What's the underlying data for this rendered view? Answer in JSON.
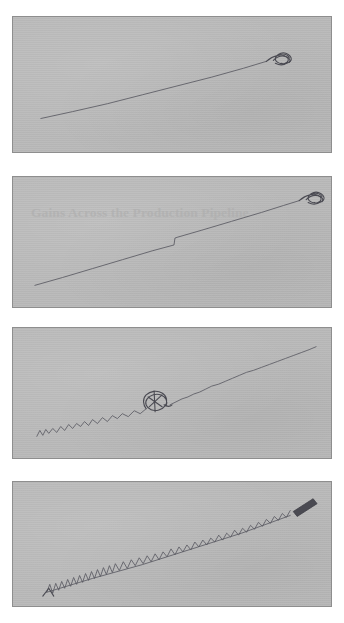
{
  "page": {
    "background_color": "#ffffff",
    "panel_fill_color": "#b9b9b9",
    "panel_border_color": "#8e8e8e",
    "ink_color": "#5e5e66"
  },
  "watermark": {
    "text": "Gains Across the Production Pipeline"
  },
  "panels": [
    {
      "id": "panel-1",
      "name": "sketch-panel-1",
      "description": "clean ascending straight line with small scribble blob at upper right end",
      "noise_level": "none",
      "endpoint_marker": "scribble-blob"
    },
    {
      "id": "panel-2",
      "name": "sketch-panel-2",
      "description": "ascending line with a single step discontinuity and scribble blob at upper right end, faint watermark title behind",
      "noise_level": "low",
      "endpoint_marker": "scribble-blob"
    },
    {
      "id": "panel-3",
      "name": "sketch-panel-3",
      "description": "ascending jittery line with a looped scribble knot near the middle",
      "noise_level": "medium",
      "endpoint_marker": "loop-knot-midline"
    },
    {
      "id": "panel-4",
      "name": "sketch-panel-4",
      "description": "ascending heavily jittery line with a solid dark dash mark at the upper right end",
      "noise_level": "high",
      "endpoint_marker": "dark-dash"
    }
  ]
}
